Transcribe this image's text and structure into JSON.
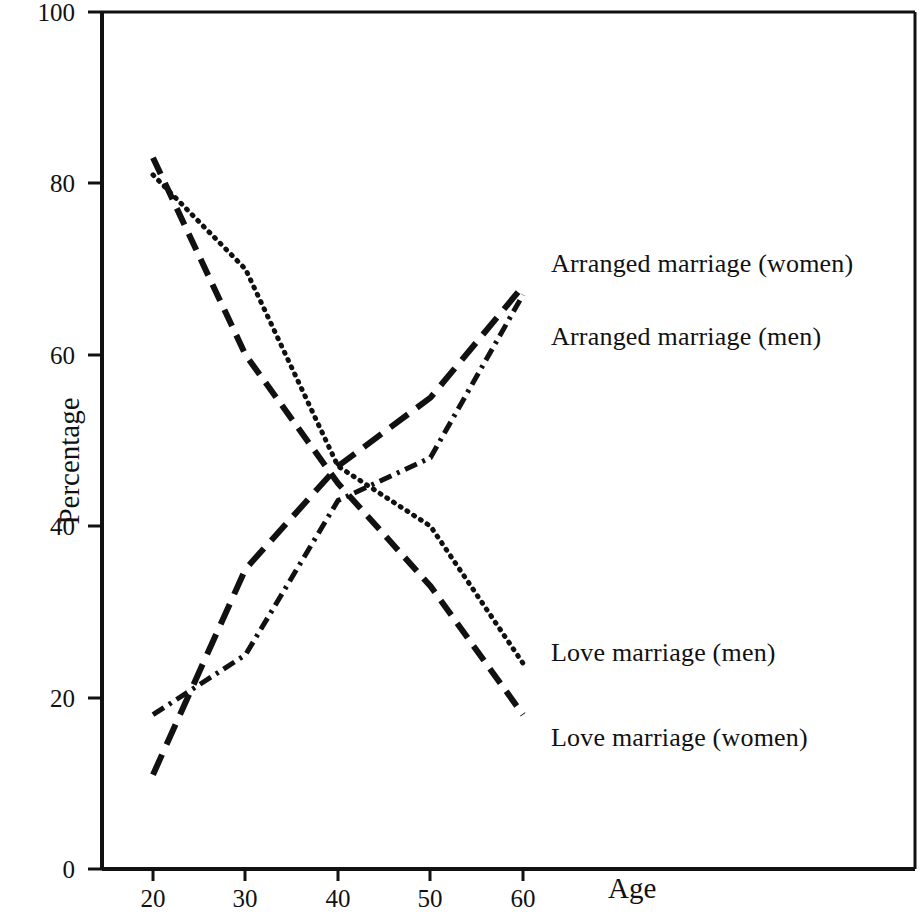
{
  "chart_data": {
    "type": "line",
    "title": "",
    "xlabel": "Age",
    "ylabel": "Percentage",
    "x": [
      20,
      30,
      40,
      50,
      60
    ],
    "xtick_labels": [
      "20",
      "30",
      "40",
      "50",
      "60"
    ],
    "ytick_labels": [
      "0",
      "20",
      "40",
      "60",
      "80",
      "100"
    ],
    "yticks": [
      0,
      20,
      40,
      60,
      80,
      100
    ],
    "xlim": [
      20,
      61
    ],
    "ylim": [
      0,
      100
    ],
    "grid": false,
    "legend_position": "right-inline",
    "series": [
      {
        "name": "Arranged marriage (women)",
        "style": "dash-dot",
        "values": [
          18,
          25,
          43,
          48,
          67
        ],
        "label_x": 60.5,
        "label_y": 73
      },
      {
        "name": "Arranged marriage (men)",
        "style": "long-dash",
        "values": [
          11,
          35,
          47,
          55,
          68
        ],
        "label_x": 60.5,
        "label_y": 62
      },
      {
        "name": "Love marriage (men)",
        "style": "dotted",
        "values": [
          81,
          70,
          47,
          40,
          24
        ],
        "label_x": 60.5,
        "label_y": 25
      },
      {
        "name": "Love marriage (women)",
        "style": "dashed",
        "values": [
          83,
          60,
          45,
          33,
          18
        ],
        "label_x": 60.5,
        "label_y": 15
      }
    ]
  },
  "axis": {
    "ylabel_text": "Percentage",
    "xlabel_text": "Age"
  },
  "colors": {
    "line": "#111111",
    "axis": "#111111",
    "background": "#ffffff"
  }
}
